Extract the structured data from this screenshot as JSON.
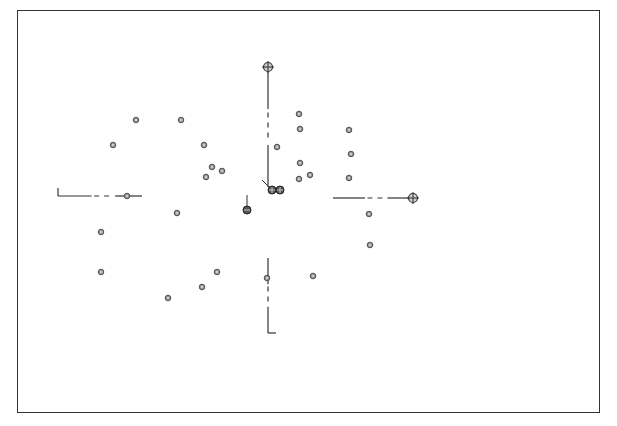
{
  "figure": {
    "caption": "",
    "frame": {
      "x": 17,
      "y": 10,
      "width": 583,
      "height": 403
    }
  },
  "colors": {
    "line": "#333333",
    "marker_fill": "#999999",
    "marker_stroke": "#444444"
  },
  "axes_marks": {
    "top": {
      "x": 268,
      "y1": 67,
      "y2": 187,
      "marker": "crosshair-circle"
    },
    "bottom": {
      "x": 268,
      "y1": 258,
      "y2": 333,
      "end": "hook-right"
    },
    "left": {
      "y": 196,
      "x1": 58,
      "x2": 142,
      "end": "hook-up"
    },
    "right": {
      "y": 198,
      "x1": 333,
      "x2": 413,
      "marker": "crosshair-circle"
    }
  },
  "center_cluster": {
    "pair": [
      {
        "x": 272,
        "y": 190
      },
      {
        "x": 280,
        "y": 190
      }
    ],
    "single": {
      "x": 247,
      "y": 210
    },
    "leader_line": {
      "x1": 262,
      "y1": 180,
      "x2": 270,
      "y2": 188
    },
    "single_stem": {
      "x": 247,
      "y1": 195,
      "y2": 206
    }
  },
  "points": [
    {
      "x": 136,
      "y": 120
    },
    {
      "x": 181,
      "y": 120
    },
    {
      "x": 113,
      "y": 145
    },
    {
      "x": 204,
      "y": 145
    },
    {
      "x": 212,
      "y": 167
    },
    {
      "x": 222,
      "y": 171
    },
    {
      "x": 206,
      "y": 177
    },
    {
      "x": 127,
      "y": 196
    },
    {
      "x": 177,
      "y": 213
    },
    {
      "x": 101,
      "y": 232
    },
    {
      "x": 101,
      "y": 272
    },
    {
      "x": 217,
      "y": 272
    },
    {
      "x": 202,
      "y": 287
    },
    {
      "x": 168,
      "y": 298
    },
    {
      "x": 299,
      "y": 114
    },
    {
      "x": 300,
      "y": 129
    },
    {
      "x": 349,
      "y": 130
    },
    {
      "x": 277,
      "y": 147
    },
    {
      "x": 351,
      "y": 154
    },
    {
      "x": 300,
      "y": 163
    },
    {
      "x": 310,
      "y": 175
    },
    {
      "x": 299,
      "y": 179
    },
    {
      "x": 349,
      "y": 178
    },
    {
      "x": 369,
      "y": 214
    },
    {
      "x": 370,
      "y": 245
    },
    {
      "x": 313,
      "y": 276
    },
    {
      "x": 267,
      "y": 278
    }
  ]
}
